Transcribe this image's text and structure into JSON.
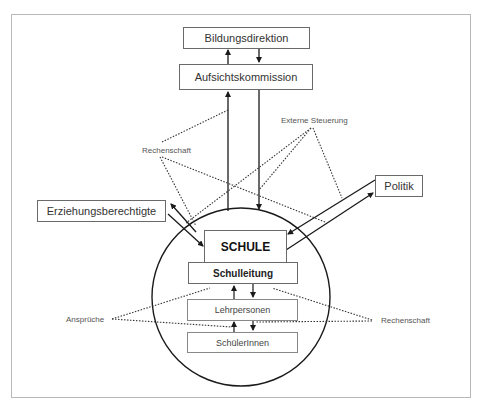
{
  "diagram": {
    "nodes": {
      "bildungsdirektion": "Bildungsdirektion",
      "aufsichtskommission": "Aufsichtskommission",
      "politik": "Politik",
      "erziehungsberechtigte": "Erziehungsberechtigte",
      "schule": "SCHULE",
      "schulleitung": "Schulleitung",
      "lehrpersonen": "Lehrpersonen",
      "schuelerinnen": "SchülerInnen"
    },
    "labels": {
      "rechenschaft_top": "Rechenschaft",
      "externe_steuerung": "Externe Steuerung",
      "ansprueche": "Ansprüche",
      "rechenschaft_right": "Rechenschaft"
    },
    "edges": [
      {
        "from": "Aufsichtskommission",
        "to": "Bildungsdirektion",
        "style": "solid-arrow"
      },
      {
        "from": "Bildungsdirektion",
        "to": "Aufsichtskommission",
        "style": "solid-arrow"
      },
      {
        "from": "SCHULE",
        "to": "Aufsichtskommission",
        "style": "solid-arrow"
      },
      {
        "from": "Aufsichtskommission",
        "to": "SCHULE",
        "style": "solid-arrow"
      },
      {
        "from": "SCHULE",
        "to": "Erziehungsberechtigte",
        "style": "solid-arrow"
      },
      {
        "from": "Erziehungsberechtigte",
        "to": "SCHULE",
        "style": "solid-arrow"
      },
      {
        "from": "SCHULE",
        "to": "Politik",
        "style": "solid-arrow"
      },
      {
        "from": "Politik",
        "to": "SCHULE",
        "style": "solid-arrow"
      },
      {
        "from": "Lehrpersonen",
        "to": "Schulleitung",
        "style": "solid-arrow"
      },
      {
        "from": "Schulleitung",
        "to": "Lehrpersonen",
        "style": "solid-arrow"
      },
      {
        "from": "SchülerInnen",
        "to": "Lehrpersonen",
        "style": "solid-arrow"
      },
      {
        "from": "Lehrpersonen",
        "to": "SchülerInnen",
        "style": "solid-arrow"
      }
    ],
    "colors": {
      "line": "#1a1a1a",
      "box_border": "#6a6a6a",
      "frame": "#b8b8b8",
      "text": "#333333",
      "label_text": "#555555"
    }
  }
}
